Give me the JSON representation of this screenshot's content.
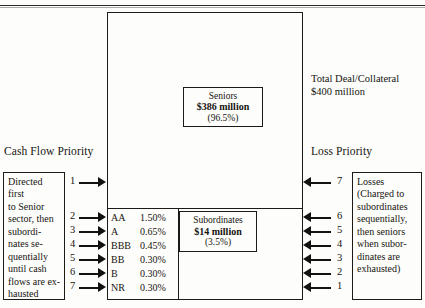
{
  "figure": {
    "main_box_label": "deal-structure-box",
    "total_deal": {
      "line1": "Total Deal/Collateral",
      "line2": "$400 million"
    },
    "cash_flow_priority_title": "Cash Flow Priority",
    "loss_priority_title": "Loss Priority",
    "seniors": {
      "name": "Seniors",
      "amount": "$386 million",
      "percent": "(96.5%)"
    },
    "subordinates": {
      "name": "Subordinates",
      "amount": "$14 million",
      "percent": "(3.5%)"
    },
    "left_note": "Directed first to Senior sector, then subordi-nates se-quentially until cash flows are ex-hausted",
    "left_note_lines": [
      "Directed first",
      "to Senior",
      "sector, then",
      "subordi-",
      "nates se-",
      "quentially",
      "until cash",
      "flows are ex-",
      "hausted"
    ],
    "right_note_lines": [
      "Losses",
      "(Charged to",
      "subordinates",
      "sequentially,",
      "then seniors",
      "when subor-",
      "dinates are",
      "exhausted)"
    ],
    "tranches": [
      {
        "rating": "AA",
        "percent": "1.50%",
        "cash_flow_order": "2",
        "loss_order": "6"
      },
      {
        "rating": "A",
        "percent": "0.65%",
        "cash_flow_order": "3",
        "loss_order": "5"
      },
      {
        "rating": "BBB",
        "percent": "0.45%",
        "cash_flow_order": "4",
        "loss_order": "4"
      },
      {
        "rating": "BB",
        "percent": "0.30%",
        "cash_flow_order": "5",
        "loss_order": "3"
      },
      {
        "rating": "B",
        "percent": "0.30%",
        "cash_flow_order": "6",
        "loss_order": "2"
      },
      {
        "rating": "NR",
        "percent": "0.30%",
        "cash_flow_order": "7",
        "loss_order": "1"
      }
    ],
    "senior_arrows": {
      "cash_flow_order": "1",
      "loss_order": "7"
    },
    "colors": {
      "ink": "#1b1a16",
      "paper": "#fdfdfb"
    }
  }
}
